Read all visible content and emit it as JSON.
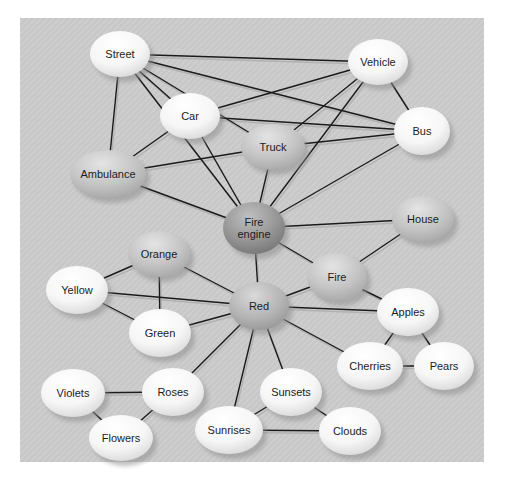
{
  "figure": {
    "type": "semantic-network-diagram",
    "canvas": {
      "width": 511,
      "height": 495,
      "background": "#ffffff"
    },
    "panel": {
      "x": 20,
      "y": 18,
      "width": 464,
      "height": 444,
      "fill": "#c8c8c8",
      "stripe": "#d0d0d0"
    },
    "edge_color": "#1a1a1a",
    "edge_shadow_color": "#b2b2b2",
    "label_color": "#1c1c1c",
    "label_font_size": 11,
    "tones": {
      "white": [
        "#ffffff",
        "#f6f6f6",
        "#d0d0d0"
      ],
      "mid": [
        "#e4e4e4",
        "#c3c3c3",
        "#9e9e9e"
      ],
      "red": [
        "#d9d9d9",
        "#b4b4b4",
        "#8e8e8e"
      ],
      "dark": [
        "#bfbfbf",
        "#959595",
        "#6d6d6d"
      ]
    }
  },
  "graph": {
    "nodes": [
      {
        "id": "street",
        "label": "Street",
        "x": 120,
        "y": 54,
        "rx": 30,
        "ry": 23,
        "tone": "white"
      },
      {
        "id": "vehicle",
        "label": "Vehicle",
        "x": 378,
        "y": 62,
        "rx": 30,
        "ry": 23,
        "tone": "white"
      },
      {
        "id": "car",
        "label": "Car",
        "x": 190,
        "y": 116,
        "rx": 30,
        "ry": 23,
        "tone": "white"
      },
      {
        "id": "bus",
        "label": "Bus",
        "x": 422,
        "y": 131,
        "rx": 28,
        "ry": 24,
        "tone": "white"
      },
      {
        "id": "truck",
        "label": "Truck",
        "x": 273,
        "y": 147,
        "rx": 32,
        "ry": 23,
        "tone": "mid"
      },
      {
        "id": "ambulance",
        "label": "Ambulance",
        "x": 108,
        "y": 174,
        "rx": 38,
        "ry": 24,
        "tone": "mid"
      },
      {
        "id": "fireengine",
        "label": "Fire engine",
        "x": 254,
        "y": 228,
        "rx": 31,
        "ry": 26,
        "tone": "dark",
        "lines": [
          "Fire",
          "engine"
        ]
      },
      {
        "id": "house",
        "label": "House",
        "x": 423,
        "y": 219,
        "rx": 31,
        "ry": 23,
        "tone": "mid"
      },
      {
        "id": "orange",
        "label": "Orange",
        "x": 159,
        "y": 254,
        "rx": 31,
        "ry": 23,
        "tone": "mid"
      },
      {
        "id": "fire",
        "label": "Fire",
        "x": 337,
        "y": 277,
        "rx": 30,
        "ry": 24,
        "tone": "mid"
      },
      {
        "id": "yellow",
        "label": "Yellow",
        "x": 77,
        "y": 290,
        "rx": 31,
        "ry": 24,
        "tone": "white"
      },
      {
        "id": "red",
        "label": "Red",
        "x": 259,
        "y": 306,
        "rx": 30,
        "ry": 24,
        "tone": "red"
      },
      {
        "id": "green",
        "label": "Green",
        "x": 160,
        "y": 333,
        "rx": 31,
        "ry": 24,
        "tone": "white"
      },
      {
        "id": "apples",
        "label": "Apples",
        "x": 408,
        "y": 312,
        "rx": 31,
        "ry": 24,
        "tone": "white"
      },
      {
        "id": "cherries",
        "label": "Cherries",
        "x": 370,
        "y": 366,
        "rx": 33,
        "ry": 24,
        "tone": "white"
      },
      {
        "id": "pears",
        "label": "Pears",
        "x": 444,
        "y": 366,
        "rx": 30,
        "ry": 24,
        "tone": "white"
      },
      {
        "id": "violets",
        "label": "Violets",
        "x": 73,
        "y": 393,
        "rx": 32,
        "ry": 24,
        "tone": "white"
      },
      {
        "id": "roses",
        "label": "Roses",
        "x": 173,
        "y": 392,
        "rx": 31,
        "ry": 24,
        "tone": "white"
      },
      {
        "id": "flowers",
        "label": "Flowers",
        "x": 121,
        "y": 438,
        "rx": 32,
        "ry": 23,
        "tone": "white"
      },
      {
        "id": "sunrises",
        "label": "Sunrises",
        "x": 229,
        "y": 430,
        "rx": 34,
        "ry": 24,
        "tone": "white"
      },
      {
        "id": "sunsets",
        "label": "Sunsets",
        "x": 291,
        "y": 392,
        "rx": 31,
        "ry": 24,
        "tone": "white"
      },
      {
        "id": "clouds",
        "label": "Clouds",
        "x": 350,
        "y": 431,
        "rx": 31,
        "ry": 24,
        "tone": "white"
      }
    ],
    "edges": [
      [
        "street",
        "vehicle"
      ],
      [
        "street",
        "car"
      ],
      [
        "street",
        "truck"
      ],
      [
        "street",
        "bus"
      ],
      [
        "street",
        "ambulance"
      ],
      [
        "street",
        "fireengine"
      ],
      [
        "vehicle",
        "car"
      ],
      [
        "vehicle",
        "truck"
      ],
      [
        "vehicle",
        "bus"
      ],
      [
        "vehicle",
        "fireengine"
      ],
      [
        "car",
        "ambulance"
      ],
      [
        "car",
        "bus"
      ],
      [
        "car",
        "fireengine"
      ],
      [
        "truck",
        "ambulance"
      ],
      [
        "truck",
        "bus"
      ],
      [
        "truck",
        "fireengine"
      ],
      [
        "bus",
        "fireengine"
      ],
      [
        "ambulance",
        "fireengine"
      ],
      [
        "fireengine",
        "house"
      ],
      [
        "fireengine",
        "fire"
      ],
      [
        "fireengine",
        "red"
      ],
      [
        "fire",
        "house"
      ],
      [
        "fire",
        "red"
      ],
      [
        "fire",
        "apples"
      ],
      [
        "red",
        "orange"
      ],
      [
        "red",
        "yellow"
      ],
      [
        "red",
        "green"
      ],
      [
        "red",
        "apples"
      ],
      [
        "red",
        "cherries"
      ],
      [
        "red",
        "roses"
      ],
      [
        "red",
        "sunrises"
      ],
      [
        "red",
        "sunsets"
      ],
      [
        "orange",
        "yellow"
      ],
      [
        "orange",
        "green"
      ],
      [
        "yellow",
        "green"
      ],
      [
        "apples",
        "cherries"
      ],
      [
        "apples",
        "pears"
      ],
      [
        "cherries",
        "pears"
      ],
      [
        "roses",
        "violets"
      ],
      [
        "roses",
        "flowers"
      ],
      [
        "violets",
        "flowers"
      ],
      [
        "sunsets",
        "sunrises"
      ],
      [
        "sunsets",
        "clouds"
      ],
      [
        "sunrises",
        "clouds"
      ]
    ]
  }
}
